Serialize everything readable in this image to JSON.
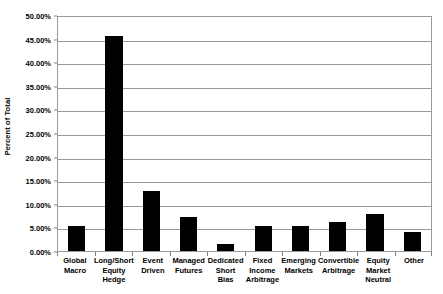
{
  "chart_data": {
    "type": "bar",
    "title": "",
    "xlabel": "",
    "ylabel": "Percent of Total",
    "ylim": [
      0,
      50
    ],
    "ytick_step": 5,
    "ytick_labels": [
      "50.00%",
      "45.00%",
      "40.00%",
      "35.00%",
      "30.00%",
      "25.00%",
      "20.00%",
      "15.00%",
      "10.00%",
      "5.00%",
      "0.00%"
    ],
    "ytick_values": [
      50,
      45,
      40,
      35,
      30,
      25,
      20,
      15,
      10,
      5,
      0
    ],
    "categories": [
      "Global Macro",
      "Long/Short Equity Hedge",
      "Event Driven",
      "Managed Futures",
      "Dedicated Short Bias",
      "Fixed Income Arbitrage",
      "Emerging Markets",
      "Convertible Arbitrage",
      "Equity Market Neutral",
      "Other"
    ],
    "values": [
      5.4,
      45.5,
      12.7,
      7.2,
      1.4,
      5.3,
      5.4,
      6.2,
      7.9,
      4.1
    ],
    "grid": true,
    "legend": false,
    "bar_color": "#000000",
    "grid_color": "#9a9a9a",
    "plot_background": "#ffffff"
  }
}
